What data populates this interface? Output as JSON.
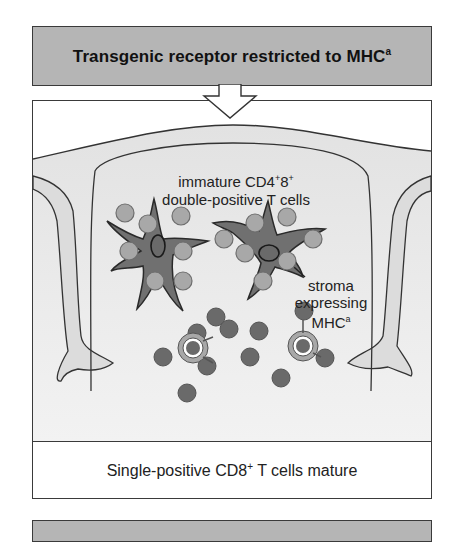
{
  "header": {
    "title": "Transgenic receptor restricted to MHC",
    "title_sup": "a"
  },
  "illustration": {
    "label_dp_line1": "immature CD4",
    "label_dp_line1_sup1": "+",
    "label_dp_line1_mid": "8",
    "label_dp_line1_sup2": "+",
    "label_dp_line2": "double-positive T cells",
    "label_stroma_line1": "stroma",
    "label_stroma_line2": "expressing",
    "label_stroma_line3": "MHC",
    "label_stroma_line3_sup": "a"
  },
  "footer": {
    "result_prefix": "Single-positive CD8",
    "result_sup": "+",
    "result_suffix": " T cells mature"
  },
  "colors": {
    "header_fill": "#b5b5b5",
    "stroma_fill": "#707070",
    "dp_cell_fill": "#a8a8a8",
    "sp_cell_fill": "#6a6a6a",
    "background_tissue": "#e6e6e6"
  }
}
